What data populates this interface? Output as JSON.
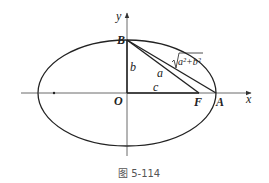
{
  "figure": {
    "caption": "图 5-114",
    "axes": {
      "x_label": "x",
      "y_label": "y"
    },
    "points": {
      "origin": "O",
      "top_vertex": "B",
      "right_vertex": "A",
      "focus": "F"
    },
    "segments": {
      "OB": "b",
      "OF": "c",
      "BF": "a",
      "BA_prefix": "√",
      "BA": "a²+b²"
    },
    "colors": {
      "stroke": "#222222",
      "axis": "#444444",
      "caption": "#555555"
    }
  }
}
